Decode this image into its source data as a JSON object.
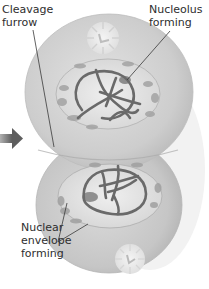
{
  "figure": {
    "colors": {
      "cell_fill": "#cfcfcf",
      "cell_edge": "#a9a9a9",
      "nucleus_fill": "#e6e6e6",
      "chromosome": "#6a6a6a",
      "organelle": "#9a9a9a",
      "arrow": "#6b6b6b",
      "leader_line": "#3a3a3a",
      "text": "#2e2e2e"
    }
  },
  "labels": {
    "cleavage_furrow": "Cleavage\nfurrow",
    "nucleolus_forming": "Nucleolus\nforming",
    "nuclear_envelope_forming": "Nuclear\nenvelope\nforming"
  }
}
